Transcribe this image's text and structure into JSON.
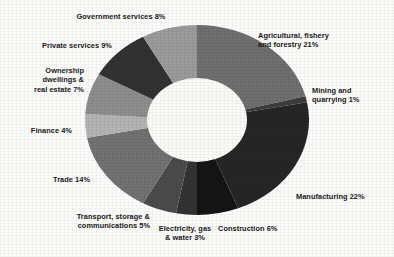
{
  "chart_data": {
    "type": "pie",
    "variant": "donut",
    "title": "",
    "subtitle": "",
    "xlabel": "",
    "ylabel": "",
    "legend_position": "outside-labels",
    "grid": false,
    "units": "percent",
    "total": 100,
    "categories": [
      "Agricultural, fishery and forestry",
      "Mining and quarrying",
      "Manufacturing",
      "Construction",
      "Electricity, gas & water",
      "Transport, storage & communications",
      "Trade",
      "Finance",
      "Ownership dwellings & real estate",
      "Private services",
      "Government services"
    ],
    "values": [
      21,
      1,
      22,
      6,
      3,
      5,
      14,
      4,
      7,
      9,
      8
    ],
    "slices": [
      {
        "label": "Agricultural, fishery\nand forestry 21%",
        "name": "Agricultural, fishery and forestry",
        "value": 21,
        "color": "#6f6f6f"
      },
      {
        "label": "Mining and\nquarrying 1%",
        "name": "Mining and quarrying",
        "value": 1,
        "color": "#3d3d3d"
      },
      {
        "label": "Manufacturing 22%",
        "name": "Manufacturing",
        "value": 22,
        "color": "#262626"
      },
      {
        "label": "Construction 6%",
        "name": "Construction",
        "value": 6,
        "color": "#151515"
      },
      {
        "label": "Electricity, gas\n& water 3%",
        "name": "Electricity, gas & water",
        "value": 3,
        "color": "#333333"
      },
      {
        "label": "Transport, storage &\ncommunications 5%",
        "name": "Transport, storage & communications",
        "value": 5,
        "color": "#4b4b4b"
      },
      {
        "label": "Trade 14%",
        "name": "Trade",
        "value": 14,
        "color": "#727272"
      },
      {
        "label": "Finance 4%",
        "name": "Finance",
        "value": 4,
        "color": "#b4b4b4"
      },
      {
        "label": "Ownership\ndwellings &\nreal estate 7%",
        "name": "Ownership dwellings & real estate",
        "value": 7,
        "color": "#8e8e8e"
      },
      {
        "label": "Private services 9%",
        "name": "Private services",
        "value": 9,
        "color": "#323232"
      },
      {
        "label": "Government services 8%",
        "name": "Government services",
        "value": 8,
        "color": "#9b9b9b"
      }
    ],
    "colors": {
      "background": "#fdfdfb",
      "hole": "#fbfbf7",
      "label_text": "#1a1a1a"
    },
    "geometry": {
      "center_x": 197,
      "center_y": 120,
      "radius_x": 112,
      "radius_y": 95,
      "hole_radius_x": 50,
      "hole_radius_y": 42,
      "start_angle_deg": -90,
      "direction": "clockwise"
    }
  }
}
